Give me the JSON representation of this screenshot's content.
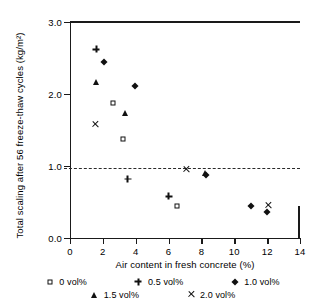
{
  "chart_data": {
    "type": "scatter",
    "title": "",
    "xlabel": "Air content in fresh concrete (%)",
    "ylabel": "Total scaling after 56 freeze-thaw cycles (kg/m²)",
    "xlim": [
      0,
      14
    ],
    "ylim": [
      0.0,
      3.0
    ],
    "xticks": [
      "0",
      "2",
      "4",
      "6",
      "8",
      "10",
      "12",
      "14"
    ],
    "xtick_values": [
      0,
      2,
      4,
      6,
      8,
      10,
      12,
      14
    ],
    "yticks": [
      "0.0",
      "1.0",
      "2.0",
      "3.0"
    ],
    "ytick_values": [
      0.0,
      1.0,
      2.0,
      3.0
    ],
    "grid": false,
    "legend_position": "below",
    "annotations": [
      {
        "name": "reference-line",
        "type": "hline",
        "y": 0.97,
        "style": "dashed",
        "label": ""
      }
    ],
    "series": [
      {
        "name": "0 vol%",
        "marker": "open-square",
        "points": [
          {
            "x": 2.6,
            "y": 1.87
          },
          {
            "x": 3.2,
            "y": 1.38
          },
          {
            "x": 6.5,
            "y": 0.44
          }
        ]
      },
      {
        "name": "0.5 vol%",
        "marker": "plus",
        "points": [
          {
            "x": 1.6,
            "y": 2.62
          },
          {
            "x": 3.5,
            "y": 0.82
          },
          {
            "x": 6.0,
            "y": 0.58
          }
        ]
      },
      {
        "name": "1.0 vol%",
        "marker": "filled-diamond",
        "points": [
          {
            "x": 2.05,
            "y": 2.44
          },
          {
            "x": 3.95,
            "y": 2.11
          },
          {
            "x": 8.25,
            "y": 0.88
          },
          {
            "x": 11.0,
            "y": 0.44
          },
          {
            "x": 12.0,
            "y": 0.36
          }
        ]
      },
      {
        "name": "1.5 vol%",
        "marker": "filled-triangle",
        "points": [
          {
            "x": 1.6,
            "y": 2.16
          },
          {
            "x": 3.35,
            "y": 1.74
          },
          {
            "x": 8.2,
            "y": 0.9
          }
        ]
      },
      {
        "name": "2.0 vol%",
        "marker": "cross",
        "points": [
          {
            "x": 1.55,
            "y": 1.58
          },
          {
            "x": 7.05,
            "y": 0.95
          },
          {
            "x": 12.05,
            "y": 0.45
          }
        ]
      }
    ]
  },
  "legend": {
    "rows": [
      [
        {
          "label": "0 vol%",
          "marker": "open-square"
        },
        {
          "label": "0.5 vol%",
          "marker": "plus"
        },
        {
          "label": "1.0 vol%",
          "marker": "filled-diamond"
        }
      ],
      [
        {
          "label": "1.5 vol%",
          "marker": "filled-triangle"
        },
        {
          "label": "2.0 vol%",
          "marker": "cross"
        }
      ]
    ]
  },
  "colors": {
    "axis": "#1a1a1a",
    "marker": "#111111",
    "reference_line": "#2a2a2a",
    "background": "#ffffff"
  }
}
